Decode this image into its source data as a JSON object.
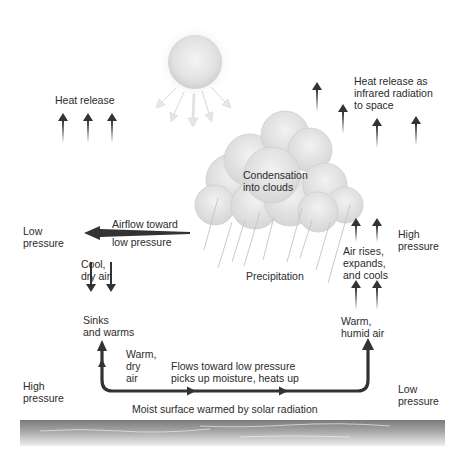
{
  "diagram": {
    "type": "atmospheric-convection-cycle",
    "labels": {
      "heat_release_left": "Heat release",
      "heat_release_right_1": "Heat release as",
      "heat_release_right_2": "infrared radiation",
      "heat_release_right_3": "to space",
      "condensation_1": "Condensation",
      "condensation_2": "into clouds",
      "precipitation": "Precipitation",
      "airflow_1": "Airflow toward",
      "airflow_2": "low pressure",
      "low_pressure_top_1": "Low",
      "low_pressure_top_2": "pressure",
      "high_pressure_top_1": "High",
      "high_pressure_top_2": "pressure",
      "cool_dry_1": "Cool,",
      "cool_dry_2": "dry air",
      "sinks_1": "Sinks",
      "sinks_2": "and warms",
      "warm_dry_1": "Warm,",
      "warm_dry_2": "dry",
      "warm_dry_3": "air",
      "flows_1": "Flows toward low pressure",
      "flows_2": "picks up moisture, heats up",
      "air_rises_1": "Air rises,",
      "air_rises_2": "expands,",
      "air_rises_3": "and cools",
      "warm_humid_1": "Warm,",
      "warm_humid_2": "humid air",
      "high_pressure_bottom_1": "High",
      "high_pressure_bottom_2": "pressure",
      "low_pressure_bottom_1": "Low",
      "low_pressure_bottom_2": "pressure",
      "surface": "Moist surface warmed by solar radiation"
    },
    "colors": {
      "arrow": "#333333",
      "sun": "#dcdcdc",
      "cloud": "#e6e6e6",
      "surface_dark": "#8a8a8a",
      "surface_light": "#d8d8d8"
    }
  }
}
